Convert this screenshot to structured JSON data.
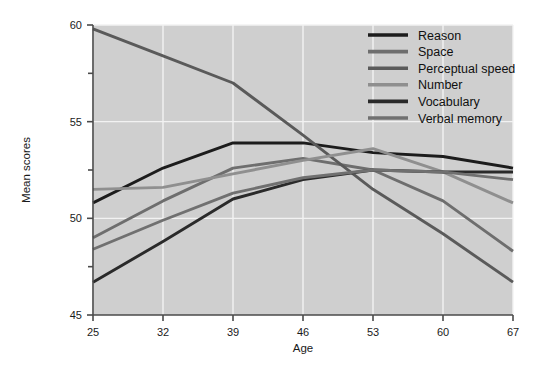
{
  "chart_data": {
    "type": "line",
    "title": "",
    "xlabel": "Age",
    "ylabel": "Mean scores",
    "x": [
      25,
      32,
      39,
      46,
      53,
      60,
      67
    ],
    "xtick_labels": [
      "25",
      "32",
      "39",
      "46",
      "53",
      "60",
      "67"
    ],
    "ytick_labels": [
      "45",
      "50",
      "55",
      "60"
    ],
    "ytick_values": [
      45,
      50,
      55,
      60
    ],
    "yminor_values": [
      47.5,
      52.5,
      57.5
    ],
    "xlim": [
      25,
      67
    ],
    "ylim": [
      45,
      60
    ],
    "grid": true,
    "legend_position": "top-right",
    "plot_background": "#cfcfcf",
    "series": [
      {
        "name": "Reason",
        "color": "#1c1c1c",
        "values": [
          50.8,
          52.6,
          53.9,
          53.9,
          53.4,
          53.2,
          52.6
        ]
      },
      {
        "name": "Space",
        "color": "#6e6e6e",
        "values": [
          49.0,
          50.9,
          52.6,
          53.1,
          52.5,
          50.9,
          48.3
        ]
      },
      {
        "name": "Perceptual speed",
        "color": "#5a5a5a",
        "values": [
          59.8,
          58.4,
          57.0,
          54.3,
          51.5,
          49.2,
          46.7
        ]
      },
      {
        "name": "Number",
        "color": "#8f8f8f",
        "values": [
          51.5,
          51.6,
          52.3,
          53.0,
          53.6,
          52.4,
          50.8
        ]
      },
      {
        "name": "Vocabulary",
        "color": "#2a2a2a",
        "values": [
          46.7,
          48.8,
          51.0,
          52.0,
          52.5,
          52.4,
          52.4
        ]
      },
      {
        "name": "Verbal memory",
        "color": "#707070",
        "values": [
          48.4,
          49.9,
          51.3,
          52.1,
          52.5,
          52.4,
          52.0
        ]
      }
    ]
  },
  "legend": {
    "entries": [
      {
        "label": "Reason"
      },
      {
        "label": "Space"
      },
      {
        "label": "Perceptual speed"
      },
      {
        "label": "Number"
      },
      {
        "label": "Vocabulary"
      },
      {
        "label": "Verbal memory"
      }
    ]
  }
}
